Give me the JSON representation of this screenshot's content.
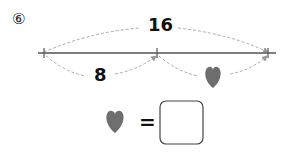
{
  "problem": {
    "number_label": "⑥",
    "total_label": "16",
    "left_segment_label": "8",
    "right_segment_symbol": "heart-icon",
    "equation": {
      "lhs_symbol": "heart-icon",
      "operator": "=",
      "answer_box_value": ""
    }
  },
  "colors": {
    "line": "#555555",
    "dashed_arrow": "#aaaaaa",
    "heart": "#6e6e6e",
    "box_border": "#444444"
  }
}
